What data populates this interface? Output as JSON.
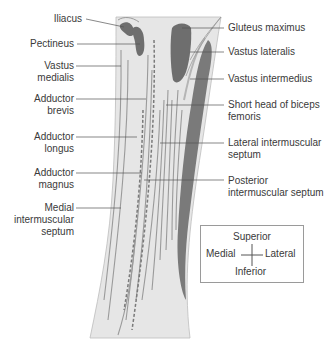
{
  "labels_left": [
    {
      "id": "iliacus",
      "text": "Iliacus",
      "lines": [
        "Iliacus"
      ],
      "x": 45,
      "y": 13
    },
    {
      "id": "pectineus",
      "text": "Pectineus",
      "lines": [
        "Pectineus"
      ],
      "x": 28,
      "y": 38
    },
    {
      "id": "vastus-medialis",
      "text": "Vastus medialis",
      "lines": [
        "Vastus",
        "medialis"
      ],
      "x": 42,
      "y": 60
    },
    {
      "id": "adductor-brevis",
      "text": "Adductor brevis",
      "lines": [
        "Adductor",
        "brevis"
      ],
      "x": 30,
      "y": 93
    },
    {
      "id": "adductor-longus",
      "text": "Adductor longus",
      "lines": [
        "Adductor",
        "longus"
      ],
      "x": 30,
      "y": 131
    },
    {
      "id": "adductor-magnus",
      "text": "Adductor magnus",
      "lines": [
        "Adductor",
        "magnus"
      ],
      "x": 30,
      "y": 167
    },
    {
      "id": "medial-intermuscular-septum",
      "text": "Medial intermuscular septum",
      "lines": [
        "Medial",
        "intermuscular",
        "septum"
      ],
      "x": 8,
      "y": 204
    }
  ],
  "labels_right": [
    {
      "id": "gluteus-maximus",
      "text": "Gluteus maximus",
      "lines": [
        "Gluteus maximus"
      ],
      "x": 228,
      "y": 22
    },
    {
      "id": "vastus-lateralis",
      "text": "Vastus lateralis",
      "lines": [
        "Vastus lateralis"
      ],
      "x": 228,
      "y": 46
    },
    {
      "id": "vastus-intermedius",
      "text": "Vastus intermedius",
      "lines": [
        "Vastus intermedius"
      ],
      "x": 228,
      "y": 73
    },
    {
      "id": "short-head-biceps-femoris",
      "text": "Short head of biceps femoris",
      "lines": [
        "Short head of biceps",
        "femoris"
      ],
      "x": 228,
      "y": 99
    },
    {
      "id": "lateral-intermuscular-septum",
      "text": "Lateral intermuscular septum",
      "lines": [
        "Lateral intermuscular",
        "septum"
      ],
      "x": 228,
      "y": 138
    },
    {
      "id": "posterior-intermuscular-septum",
      "text": "Posterior intermuscular septum",
      "lines": [
        "Posterior",
        "intermuscular septum"
      ],
      "x": 228,
      "y": 176
    }
  ],
  "orientation_legend": {
    "superior": "Superior",
    "inferior": "Inferior",
    "medial": "Medial",
    "lateral": "Lateral"
  },
  "colors": {
    "background": "#ffffff",
    "thigh_fill": "#e6e6e6",
    "muscle_dark": "#6e6e6e",
    "muscle_mid": "#808080",
    "fiber_line": "#9a9a9a",
    "septum_dashed": "#7a7a7a",
    "label_text": "#3a3a3a",
    "leader_line": "#555555"
  }
}
